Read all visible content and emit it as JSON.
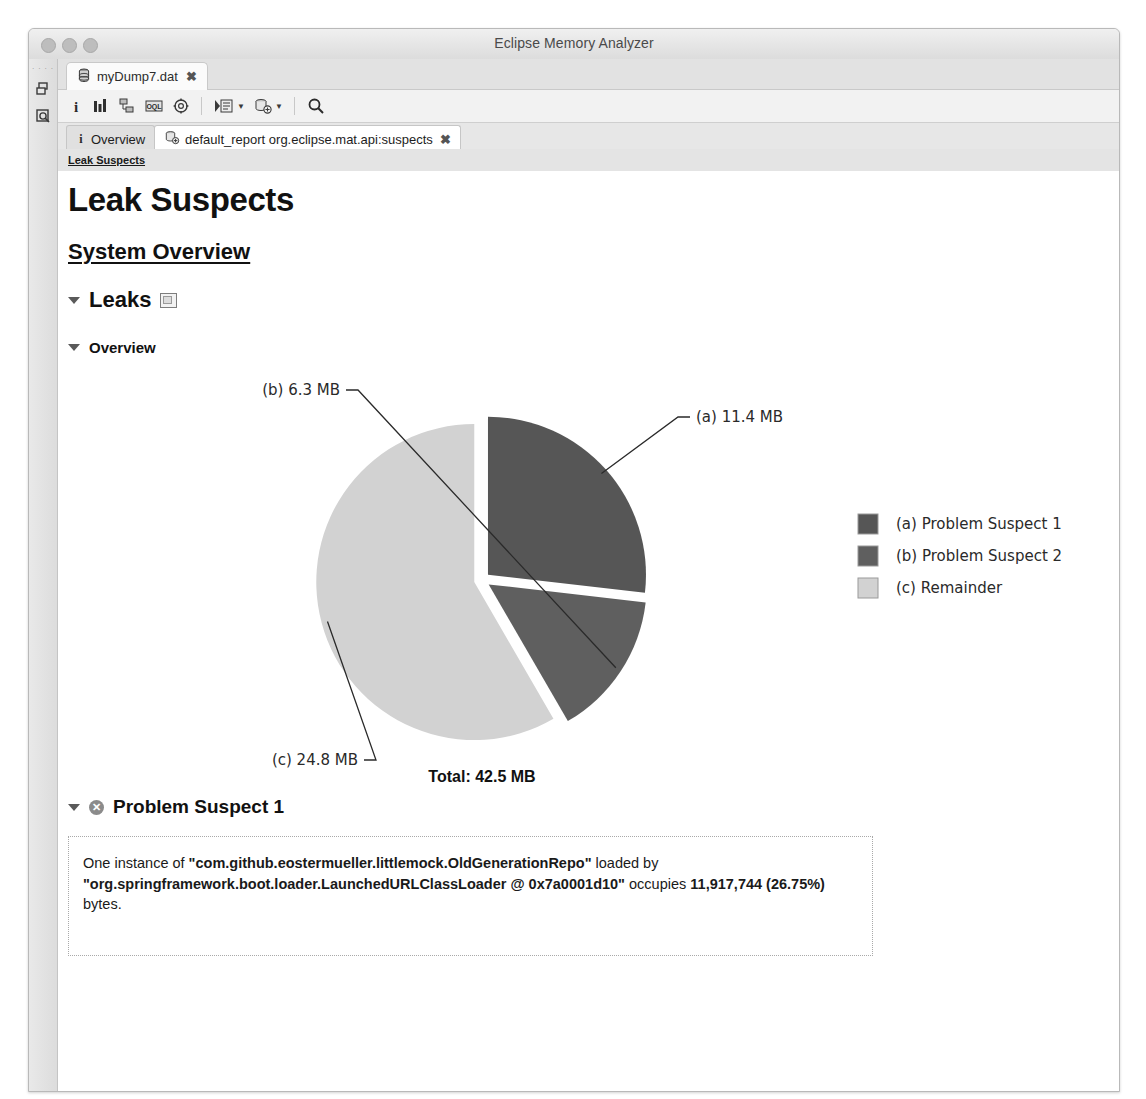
{
  "window": {
    "title": "Eclipse Memory Analyzer",
    "traffic_lights": [
      "close",
      "minimize",
      "zoom"
    ]
  },
  "rail": {
    "dots": "· · · ·",
    "items": [
      {
        "name": "heap-dump-history-icon",
        "label": ""
      },
      {
        "name": "open-query-browser-icon",
        "label": ""
      }
    ]
  },
  "editor_tab": {
    "label": "myDump7.dat",
    "close": "✖",
    "icon": "heap-dump-icon"
  },
  "toolbar": {
    "items": [
      {
        "name": "overview-info-icon",
        "glyph": "i"
      },
      {
        "name": "histogram-icon",
        "glyph": "bars"
      },
      {
        "name": "dominator-tree-icon",
        "glyph": "tree"
      },
      {
        "name": "oql-icon",
        "glyph": "oql"
      },
      {
        "name": "inspector-icon",
        "glyph": "gear"
      },
      {
        "name": "run-expert-system-test-icon",
        "glyph": "report",
        "has_menu": true
      },
      {
        "name": "open-query-browser-icon",
        "glyph": "query",
        "has_menu": true
      },
      {
        "name": "find-object-icon",
        "glyph": "search"
      }
    ]
  },
  "view_tabs": [
    {
      "label": "Overview",
      "icon": "info-icon",
      "active": false
    },
    {
      "label": "default_report org.eclipse.mat.api:suspects",
      "icon": "report-icon",
      "active": true,
      "close": "✖"
    }
  ],
  "report": {
    "breadcrumb": "Leak Suspects",
    "title": "Leak Suspects",
    "subtitle": "System Overview",
    "sections": [
      {
        "name": "leaks",
        "label": "Leaks",
        "expanded": true,
        "has_mini_icon": true
      },
      {
        "name": "overview",
        "label": "Overview",
        "expanded": true
      },
      {
        "name": "problem-suspect-1",
        "label": "Problem Suspect 1",
        "expanded": true,
        "has_error_icon": true
      }
    ],
    "description": {
      "line1_pre": "One instance of ",
      "line1_bold": "\"com.github.eostermueller.littlemock.OldGenerationRepo\"",
      "line1_post": " loaded by ",
      "line2_bold": "\"org.springframework.boot.loader.LaunchedURLClassLoader @ 0x7a0001d10\"",
      "line2_post": " occupies ",
      "line3_bold": "11,917,744 (26.75%)",
      "line3_post": " bytes."
    }
  },
  "chart_data": {
    "type": "pie",
    "title": "",
    "total_label": "Total: 42.5 MB",
    "total_value": 42.5,
    "unit": "MB",
    "legend_position": "right",
    "categories": [
      "(a) Problem Suspect 1",
      "(b) Problem Suspect 2",
      "(c) Remainder"
    ],
    "values": [
      11.4,
      6.3,
      24.8
    ],
    "point_labels": [
      "(a)  11.4 MB",
      "(b)  6.3 MB",
      "(c)  24.8 MB"
    ],
    "colors": [
      "#565656",
      "#5f5f5f",
      "#d2d2d2"
    ],
    "legend": [
      {
        "key": "(a)",
        "label": "Problem Suspect 1",
        "color": "#565656"
      },
      {
        "key": "(b)",
        "label": "Problem Suspect 2",
        "color": "#5f5f5f"
      },
      {
        "key": "(c)",
        "label": "Remainder",
        "color": "#d2d2d2"
      }
    ],
    "exploded": true,
    "start_angle_deg": 0
  }
}
